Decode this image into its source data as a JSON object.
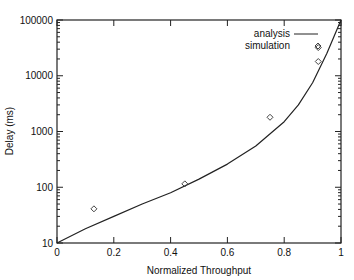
{
  "chart_data": {
    "type": "line",
    "title": "",
    "xlabel": "Normalized Throughput",
    "ylabel": "Delay (ms)",
    "xlim": [
      0,
      1
    ],
    "ylim": [
      10,
      100000
    ],
    "yscale": "log",
    "grid": false,
    "legend_position": "top-right",
    "x_ticks": [
      "0",
      "0.2",
      "0.4",
      "0.6",
      "0.8",
      "1"
    ],
    "y_ticks": [
      "10",
      "100",
      "1000",
      "10000",
      "100000"
    ],
    "series": [
      {
        "name": "analysis",
        "style": "line",
        "x": [
          0,
          0.1,
          0.2,
          0.3,
          0.4,
          0.5,
          0.6,
          0.7,
          0.8,
          0.85,
          0.9,
          0.95,
          1.0
        ],
        "values": [
          10,
          18,
          30,
          50,
          80,
          140,
          260,
          550,
          1500,
          3000,
          7500,
          25000,
          100000
        ]
      },
      {
        "name": "simulation",
        "style": "diamond-markers",
        "x": [
          0.13,
          0.45,
          0.75,
          0.92,
          0.92
        ],
        "values": [
          41,
          115,
          1800,
          18000,
          32000
        ]
      }
    ]
  },
  "legend": {
    "analysis_label": "analysis",
    "simulation_label": "simulation"
  },
  "axes": {
    "xlabel": "Normalized Throughput",
    "ylabel": "Delay (ms)"
  }
}
